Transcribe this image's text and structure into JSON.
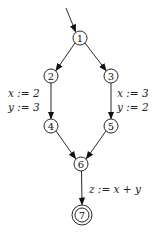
{
  "diagram": {
    "type": "control-flow-graph",
    "nodes": [
      {
        "id": "1",
        "label": "1",
        "x": 80,
        "y": 38,
        "final": false
      },
      {
        "id": "2",
        "label": "2",
        "x": 51,
        "y": 76,
        "final": false
      },
      {
        "id": "3",
        "label": "3",
        "x": 111,
        "y": 76,
        "final": false
      },
      {
        "id": "4",
        "label": "4",
        "x": 51,
        "y": 126,
        "final": false
      },
      {
        "id": "5",
        "label": "5",
        "x": 111,
        "y": 126,
        "final": false
      },
      {
        "id": "6",
        "label": "6",
        "x": 81,
        "y": 164,
        "final": false
      },
      {
        "id": "7",
        "label": "7",
        "x": 82,
        "y": 215,
        "final": true
      }
    ],
    "edges": [
      {
        "from": "start",
        "to": "1",
        "label": ""
      },
      {
        "from": "1",
        "to": "2",
        "label": ""
      },
      {
        "from": "1",
        "to": "3",
        "label": ""
      },
      {
        "from": "2",
        "to": "4",
        "label_lines": [
          "x := 2",
          "y := 3"
        ]
      },
      {
        "from": "3",
        "to": "5",
        "label_lines": [
          "x := 3",
          "y := 2"
        ]
      },
      {
        "from": "4",
        "to": "6",
        "label": ""
      },
      {
        "from": "5",
        "to": "6",
        "label": ""
      },
      {
        "from": "6",
        "to": "7",
        "label_lines": [
          "z := x + y"
        ]
      }
    ],
    "labels": {
      "e24_line1": "x := 2",
      "e24_line2": "y := 3",
      "e35_line1": "x := 3",
      "e35_line2": "y := 2",
      "e67_line1": "z := x + y"
    }
  }
}
